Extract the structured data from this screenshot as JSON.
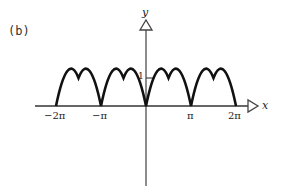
{
  "figure": {
    "panel_label": "(b)",
    "function": "|sin x|",
    "x_axis": {
      "name": "x",
      "ticks": [
        "−2π",
        "−π",
        "π",
        "2π"
      ]
    },
    "y_axis": {
      "name": "y",
      "ticks": [
        "1"
      ]
    }
  },
  "colors": {
    "curve": "#111111",
    "axes": "#555555",
    "text": "#222222"
  }
}
